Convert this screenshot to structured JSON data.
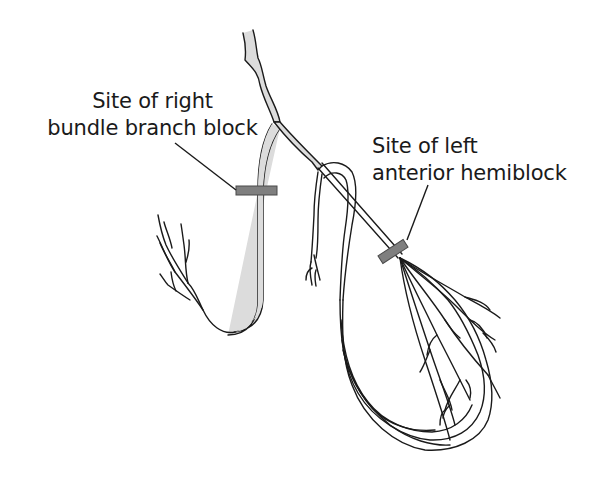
{
  "diagram": {
    "labels": {
      "rbbb": {
        "line1": "Site of right",
        "line2": "bundle branch block"
      },
      "lah": {
        "line1": "Site of left",
        "line2": "anterior hemiblock"
      }
    },
    "parts": [
      "bundle-of-his",
      "right-bundle-branch",
      "left-bundle-branch",
      "left-posterior-fascicle",
      "left-anterior-fascicle",
      "septal-branch",
      "purkinje-fibres"
    ],
    "markers": [
      {
        "name": "right-bundle-branch-block-marker",
        "color": "#7f7f7f"
      },
      {
        "name": "left-anterior-hemiblock-marker",
        "color": "#7f7f7f"
      }
    ],
    "colors": {
      "stroke": "#1a1a1a",
      "conduction_fill": "#dcdcdc",
      "block_marker": "#7f7f7f",
      "background": "#ffffff",
      "text": "#1a1a1a"
    }
  }
}
